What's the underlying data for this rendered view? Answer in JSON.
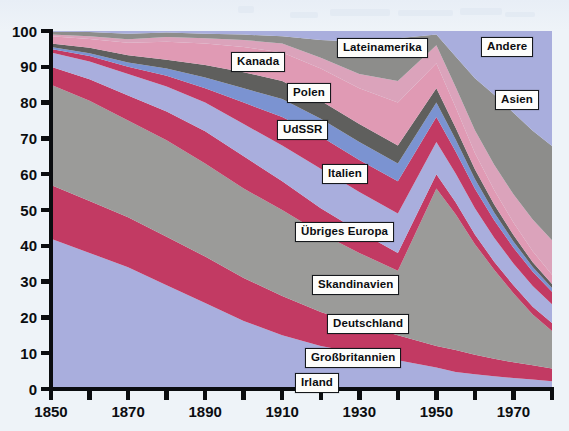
{
  "figure": {
    "kind": "stacked-area-chart",
    "background_color": "#eef3f8",
    "axis_color": "#0b0d10",
    "plot_left_px": 51,
    "plot_right_px": 552,
    "plot_top_px": 31,
    "plot_bottom_px": 389
  },
  "chart_data": {
    "type": "area",
    "title": "",
    "subtitle": "",
    "xlabel": "",
    "ylabel": "",
    "stacked": true,
    "normalized_percent": true,
    "grid": false,
    "legend_position": "inline-callout-labels",
    "xlim": [
      1850,
      1980
    ],
    "ylim": [
      0,
      100
    ],
    "x_tick_labels": [
      "1850",
      "1870",
      "1890",
      "1910",
      "1930",
      "1950",
      "1970"
    ],
    "x_tick_values": [
      1850,
      1870,
      1890,
      1910,
      1930,
      1950,
      1970
    ],
    "x_minor_tick_values": [
      1860,
      1880,
      1900,
      1920,
      1940,
      1960,
      1980
    ],
    "y_tick_labels": [
      "0",
      "10",
      "20",
      "30",
      "40",
      "50",
      "60",
      "70",
      "80",
      "90",
      "100"
    ],
    "y_tick_values": [
      0,
      10,
      20,
      30,
      40,
      50,
      60,
      70,
      80,
      90,
      100
    ],
    "x": [
      1850,
      1860,
      1870,
      1880,
      1890,
      1900,
      1910,
      1920,
      1930,
      1940,
      1950,
      1955,
      1960,
      1965,
      1970,
      1975,
      1980
    ],
    "series": [
      {
        "name": "Irland",
        "color": "#a9aedd",
        "values": [
          42,
          38,
          34,
          29,
          24,
          19,
          15,
          12,
          10,
          8,
          6,
          5,
          4.5,
          4,
          3.5,
          3,
          2.5
        ]
      },
      {
        "name": "Großbritannien",
        "color": "#c23a63",
        "values": [
          15,
          14.5,
          14,
          13.5,
          13,
          12,
          11,
          9.5,
          8,
          7,
          6,
          6.5,
          6,
          5.5,
          5,
          4.5,
          4
        ]
      },
      {
        "name": "Deutschland",
        "color": "#9b9b99",
        "values": [
          28,
          28,
          27,
          27,
          26,
          25,
          24,
          22,
          20,
          18,
          44,
          40,
          34,
          28,
          22,
          16,
          12
        ]
      },
      {
        "name": "Skandinavien",
        "color": "#c23a63",
        "values": [
          5,
          6,
          7,
          8,
          9,
          9,
          8,
          7,
          6,
          5,
          4,
          3.5,
          3,
          2.5,
          2.5,
          2.5,
          2.5
        ]
      },
      {
        "name": "Übriges Europa",
        "color": "#a9aedd",
        "values": [
          4,
          5,
          6,
          7,
          8,
          9,
          10,
          11,
          11,
          11,
          9,
          8.5,
          8,
          7.5,
          7,
          6.5,
          6
        ]
      },
      {
        "name": "Italien",
        "color": "#c23a63",
        "values": [
          1,
          1.5,
          2,
          3,
          4,
          6,
          8,
          9,
          9,
          9,
          7,
          6.5,
          6,
          5.5,
          5,
          4.5,
          4
        ]
      },
      {
        "name": "UdSSR",
        "color": "#7b93d1",
        "values": [
          0.5,
          0.8,
          1.2,
          2,
          3,
          4,
          5,
          5,
          5,
          5,
          4,
          3.5,
          3,
          2.5,
          2,
          1.5,
          1.2
        ]
      },
      {
        "name": "Polen",
        "color": "#5f5f5d",
        "values": [
          1,
          1.5,
          2,
          2.5,
          3.5,
          4.5,
          5,
          5,
          5,
          5,
          4,
          3.5,
          3,
          2.5,
          2,
          1.5,
          1.2
        ]
      },
      {
        "name": "Kanada",
        "color": "#e09ab4",
        "values": [
          2,
          2.5,
          3.5,
          5,
          6,
          7,
          8,
          9,
          10,
          12,
          7,
          6,
          5,
          4.5,
          4,
          3.5,
          3
        ]
      },
      {
        "name": "Lateinamerika",
        "color": "#dba3bb",
        "values": [
          0.5,
          0.7,
          1,
          1.3,
          1.5,
          2,
          2.5,
          3,
          4,
          6,
          5,
          6,
          7,
          8,
          9,
          10,
          11
        ]
      },
      {
        "name": "Andere",
        "color": "#8d8d8b",
        "values": [
          0.8,
          1.2,
          1.5,
          1.3,
          1.2,
          1.5,
          2,
          5,
          9,
          12,
          3,
          9,
          16,
          22,
          26,
          28,
          30
        ]
      },
      {
        "name": "Asien",
        "color": "#a9aedd",
        "values": [
          0.2,
          0.3,
          0.8,
          0.4,
          0.8,
          1,
          1.5,
          2.5,
          3,
          2,
          1,
          7.5,
          14.5,
          20,
          26,
          31.5,
          36.6
        ]
      }
    ],
    "callout_labels": [
      {
        "text": "Kanada",
        "series": "Kanada",
        "x_px": 231,
        "y_px": 52
      },
      {
        "text": "Lateinamerika",
        "series": "Lateinamerika",
        "x_px": 337,
        "y_px": 38
      },
      {
        "text": "Andere",
        "series": "Andere",
        "x_px": 481,
        "y_px": 37
      },
      {
        "text": "Polen",
        "series": "Polen",
        "x_px": 287,
        "y_px": 83
      },
      {
        "text": "Asien",
        "series": "Asien",
        "x_px": 495,
        "y_px": 90
      },
      {
        "text": "UdSSR",
        "series": "UdSSR",
        "x_px": 277,
        "y_px": 120
      },
      {
        "text": "Italien",
        "series": "Italien",
        "x_px": 322,
        "y_px": 164
      },
      {
        "text": "Übriges Europa",
        "series": "Übriges Europa",
        "x_px": 295,
        "y_px": 222
      },
      {
        "text": "Skandinavien",
        "series": "Skandinavien",
        "x_px": 312,
        "y_px": 275
      },
      {
        "text": "Deutschland",
        "series": "Deutschland",
        "x_px": 327,
        "y_px": 314
      },
      {
        "text": "Großbritannien",
        "series": "Großbritannien",
        "x_px": 305,
        "y_px": 348
      },
      {
        "text": "Irland",
        "series": "Irland",
        "x_px": 295,
        "y_px": 373
      }
    ]
  }
}
